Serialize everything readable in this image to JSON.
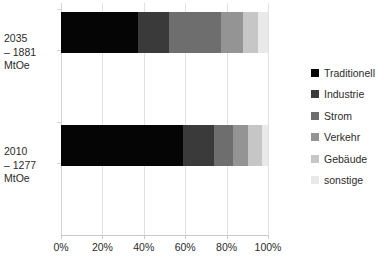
{
  "chart_data": {
    "type": "bar",
    "orientation": "horizontal",
    "stacked": true,
    "normalized": true,
    "title": "",
    "subtitle": "",
    "xlabel": "",
    "ylabel": "",
    "xlim": [
      0,
      100
    ],
    "xticks": [
      0,
      20,
      40,
      60,
      80,
      100
    ],
    "xtick_labels": [
      "0%",
      "20%",
      "40%",
      "60%",
      "80%",
      "100%"
    ],
    "grid": true,
    "grid_axis": "x",
    "legend_position": "right",
    "categories": [
      "2010 – 1277 MtOe",
      "2035 – 1881 MtOe"
    ],
    "category_lines": [
      [
        "2035",
        "– 1881",
        "MtOe"
      ],
      [
        "2010",
        "– 1277",
        "MtOe"
      ]
    ],
    "series": [
      {
        "name": "Traditionell",
        "color": "#050505",
        "values": [
          59.1,
          37.3
        ]
      },
      {
        "name": "Industrie",
        "color": "#3a3a3a",
        "values": [
          15.0,
          15.0
        ]
      },
      {
        "name": "Strom",
        "color": "#6e6e6e",
        "values": [
          9.1,
          25.0
        ]
      },
      {
        "name": "Verkehr",
        "color": "#949494",
        "values": [
          7.3,
          10.8
        ]
      },
      {
        "name": "Gebäude",
        "color": "#c6c6c6",
        "values": [
          6.5,
          6.9
        ]
      },
      {
        "name": "sonstige",
        "color": "#e9e9e9",
        "values": [
          3.0,
          5.0
        ]
      }
    ]
  },
  "bars": [
    {
      "id": "bar-2035",
      "label_lines": [
        "2035",
        "– 1881",
        "MtOe"
      ],
      "segments": [
        {
          "name": "Traditionell",
          "value": 37.3,
          "color": "#050505"
        },
        {
          "name": "Industrie",
          "value": 15.0,
          "color": "#3a3a3a"
        },
        {
          "name": "Strom",
          "value": 25.0,
          "color": "#6e6e6e"
        },
        {
          "name": "Verkehr",
          "value": 10.8,
          "color": "#949494"
        },
        {
          "name": "Gebäude",
          "value": 6.9,
          "color": "#c6c6c6"
        },
        {
          "name": "sonstige",
          "value": 5.0,
          "color": "#e9e9e9"
        }
      ]
    },
    {
      "id": "bar-2010",
      "label_lines": [
        "2010",
        "– 1277",
        "MtOe"
      ],
      "segments": [
        {
          "name": "Traditionell",
          "value": 59.1,
          "color": "#050505"
        },
        {
          "name": "Industrie",
          "value": 15.0,
          "color": "#3a3a3a"
        },
        {
          "name": "Strom",
          "value": 9.1,
          "color": "#6e6e6e"
        },
        {
          "name": "Verkehr",
          "value": 7.3,
          "color": "#949494"
        },
        {
          "name": "Gebäude",
          "value": 6.5,
          "color": "#c6c6c6"
        },
        {
          "name": "sonstige",
          "value": 3.0,
          "color": "#e9e9e9"
        }
      ]
    }
  ],
  "axis": {
    "x_tick_labels": [
      "0%",
      "20%",
      "40%",
      "60%",
      "80%",
      "100%"
    ]
  },
  "legend": {
    "items": [
      {
        "label": "Traditionell",
        "color": "#050505"
      },
      {
        "label": "Industrie",
        "color": "#3a3a3a"
      },
      {
        "label": "Strom",
        "color": "#6e6e6e"
      },
      {
        "label": "Verkehr",
        "color": "#949494"
      },
      {
        "label": "Gebäude",
        "color": "#c6c6c6"
      },
      {
        "label": "sonstige",
        "color": "#e9e9e9"
      }
    ]
  },
  "colors": {
    "gridline": "#e2e2e2",
    "axis": "#c9c9c9",
    "text": "#2b2b2b",
    "background": "#ffffff"
  }
}
